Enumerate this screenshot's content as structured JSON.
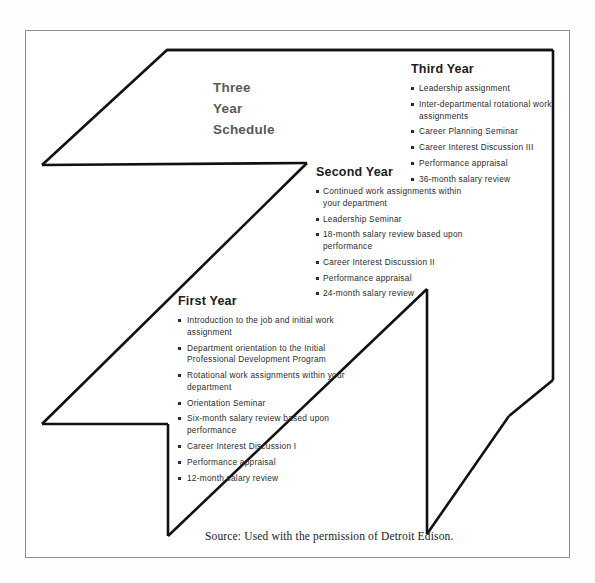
{
  "figure": {
    "title_lines": [
      "Three",
      "Year",
      "Schedule"
    ],
    "title_text": "Three Year Schedule",
    "shape_name": "numeral-three-outline",
    "stroke_color": "#111111",
    "frame_color": "#8d8d8d",
    "background_color": "#ffffff"
  },
  "years": [
    {
      "id": "third",
      "heading": "Third Year",
      "items": [
        "Leadership assignment",
        "Inter-departmental rotational work assignments",
        "Career Planning Seminar",
        "Career Interest Discussion III",
        "Performance appraisal",
        "36-month salary review"
      ]
    },
    {
      "id": "second",
      "heading": "Second Year",
      "items": [
        "Continued work assignments within your department",
        "Leadership Seminar",
        "18-month salary review based upon performance",
        "Career Interest Discussion II",
        "Performance appraisal",
        "24-month salary review"
      ]
    },
    {
      "id": "first",
      "heading": "First Year",
      "items": [
        "Introduction to the job and initial work assignment",
        "Department orientation to the Initial Professional Development Program",
        "Rotational work assignments within your department",
        "Orientation Seminar",
        "Six-month salary review based upon performance",
        "Career Interest Discussion I",
        "Performance appraisal",
        "12-month salary review"
      ]
    }
  ],
  "source": {
    "text": "Source: Used with the permission of Detroit Edison."
  }
}
